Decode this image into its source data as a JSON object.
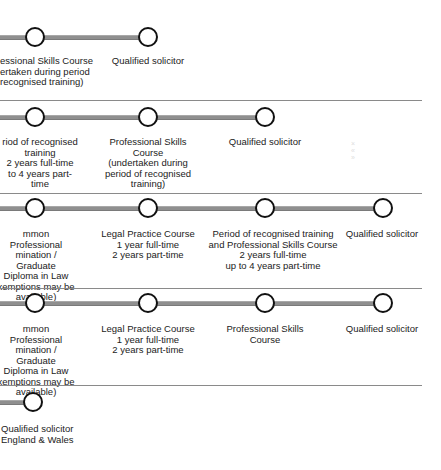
{
  "diagram": {
    "colors": {
      "track": "#8f8f8f",
      "node_stroke": "#111111",
      "node_fill": "#ffffff",
      "divider": "#8a8a8a"
    },
    "rows": [
      {
        "nodes": [
          {
            "title": "essional Skills Course",
            "sub": [
              "ertaken during period",
              "recognised training)"
            ]
          },
          {
            "title": "Qualified solicitor",
            "sub": []
          }
        ]
      },
      {
        "nodes": [
          {
            "title": "riod of recognised",
            "sub": [
              "training",
              "2 years full-time",
              "to 4 years part-time"
            ]
          },
          {
            "title": "Professional Skills",
            "sub": [
              "Course",
              "(undertaken during",
              "period of recognised",
              "training)"
            ]
          },
          {
            "title": "Qualified solicitor",
            "sub": []
          }
        ]
      },
      {
        "nodes": [
          {
            "title": "mmon Professional",
            "sub": [
              "mination / Graduate",
              "Diploma in Law",
              "xemptions may be",
              "available)"
            ]
          },
          {
            "title": "Legal Practice Course",
            "sub": [
              "1 year full-time",
              "2 years part-time"
            ]
          },
          {
            "title": "Period of recognised training",
            "sub": [
              "and Professional Skills Course",
              "2 years full-time",
              "up to 4 years part-time"
            ]
          },
          {
            "title": "Qualified solicitor",
            "sub": []
          }
        ]
      },
      {
        "nodes": [
          {
            "title": "mmon Professional",
            "sub": [
              "mination / Graduate",
              "Diploma in Law",
              "xemptions may be",
              "available)"
            ]
          },
          {
            "title": "Legal Practice Course",
            "sub": [
              "1 year full-time",
              "2 years part-time"
            ]
          },
          {
            "title": "Professional Skills",
            "sub": [
              "Course"
            ]
          },
          {
            "title": "Qualified solicitor",
            "sub": []
          }
        ]
      },
      {
        "nodes": [
          {
            "title": "Qualified solicitor",
            "sub": [
              "England & Wales"
            ]
          }
        ]
      }
    ]
  }
}
